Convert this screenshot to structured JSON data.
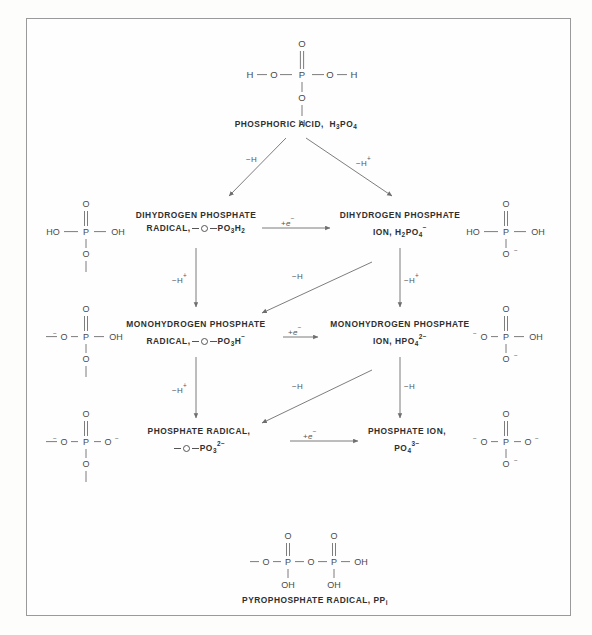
{
  "diagram": {
    "line_color": "#777777",
    "text_color": "#2f2f2f"
  },
  "top": {
    "label_name": "PHOSPHORIC ACID,",
    "label_formula_pre": "H",
    "label_formula_sub1": "3",
    "label_formula_mid": "PO",
    "label_formula_sub2": "4",
    "atoms": {
      "p": "P",
      "o_top": "O",
      "o_left": "O",
      "o_right": "O",
      "o_bottom": "O",
      "h_left": "H",
      "h_right": "H",
      "h_bottom": "H"
    }
  },
  "rows": [
    {
      "id": "dihydrogen",
      "radical": {
        "line1": "DIHYDROGEN  PHOSPHATE",
        "line2_pre": "RADICAL,",
        "formula": "PO",
        "formula_sub": "3",
        "formula_post": "H",
        "formula_post_sub": "2"
      },
      "ion": {
        "line1": "DIHYDROGEN  PHOSPHATE",
        "line2_pre": "ION,",
        "formula_pre": "H",
        "formula_sub1": "2",
        "formula_mid": "PO",
        "formula_sub2": "4",
        "charge": "−"
      },
      "struct_left": {
        "o_top": "O",
        "p": "P",
        "left": "HO",
        "right": "OH",
        "bottom": "O"
      },
      "struct_right": {
        "o_top": "O",
        "p": "P",
        "left": "HO",
        "right": "OH",
        "bottom": "O",
        "bottom_charge": "−"
      }
    },
    {
      "id": "monohydrogen",
      "radical": {
        "line1": "MONOHYDROGEN  PHOSPHATE",
        "line2_pre": "RADICAL,",
        "formula": "PO",
        "formula_sub": "3",
        "formula_post": "H",
        "formula_post_sub": "",
        "formula_charge": "−"
      },
      "ion": {
        "line1": "MONOHYDROGEN  PHOSPHATE",
        "line2_pre": "ION,",
        "formula_pre": "HPO",
        "formula_sub2": "4",
        "charge": "2−"
      },
      "struct_left": {
        "o_top": "O",
        "p": "P",
        "left": "O",
        "left_charge": "−",
        "right": "OH",
        "bottom": "O"
      },
      "struct_right": {
        "o_top": "O",
        "p": "P",
        "left": "O",
        "left_charge": "−",
        "right": "OH",
        "bottom": "O",
        "bottom_charge": "−"
      }
    },
    {
      "id": "phosphate",
      "radical": {
        "line1": "PHOSPHATE  RADICAL,",
        "line2_pre": "",
        "formula": "PO",
        "formula_sub": "3",
        "formula_charge": "2−"
      },
      "ion": {
        "line1": "PHOSPHATE  ION,",
        "line2_pre": "",
        "formula_pre": "PO",
        "formula_sub2": "4",
        "charge": "3−"
      },
      "struct_left": {
        "o_top": "O",
        "p": "P",
        "left": "O",
        "left_charge": "−",
        "right": "O",
        "right_charge": "−",
        "bottom": "O"
      },
      "struct_right": {
        "o_top": "O",
        "p": "P",
        "left": "O",
        "left_charge": "−",
        "right": "O",
        "right_charge": "−",
        "bottom": "O",
        "bottom_charge": "−"
      }
    }
  ],
  "edges": {
    "top_left_label_pre": "−",
    "top_left_label_post": "H",
    "top_right_label_pre": "−",
    "top_right_label_post": "H",
    "top_right_charge": "+",
    "deprotonation_label": "−H",
    "deprotonation_charge": "+",
    "hydrogen_loss_label": "−H",
    "electron_label_pre": "+",
    "electron_label_e": "e",
    "electron_label_charge": "−",
    "last_vertical_label": "−H"
  },
  "bottom": {
    "label": "PYROPHOSPHATE  RADICAL,  PP",
    "label_sub": "i",
    "atoms": {
      "o_top_left": "O",
      "o_top_right": "O",
      "p_left": "P",
      "p_right": "P",
      "o_bridge": "O",
      "o_term_left": "O",
      "oh_right": "OH",
      "oh_bottom_left": "OH",
      "oh_bottom_right": "OH"
    }
  }
}
